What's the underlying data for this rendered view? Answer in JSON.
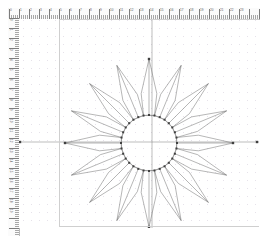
{
  "app": {
    "type": "vector-drawing-canvas",
    "background_color": "#ffffff"
  },
  "rulers": {
    "top": {
      "name": "horizontal-ruler",
      "unit": "cm",
      "labels": [
        "0",
        "1",
        "2",
        "3",
        "4",
        "5",
        "6",
        "7",
        "8",
        "9",
        "10",
        "11",
        "12",
        "13",
        "14",
        "15",
        "16",
        "17",
        "18",
        "19",
        "20",
        "21",
        "22",
        "23"
      ],
      "major_tick_spacing_px": 10,
      "minor_per_major": 5,
      "background_color": "#fbfbfb",
      "tick_color": "#8c8c8c"
    },
    "left": {
      "name": "vertical-ruler",
      "unit": "cm",
      "labels": [
        "0",
        "1",
        "2",
        "3",
        "4",
        "5",
        "6",
        "7",
        "8",
        "9",
        "10",
        "11",
        "12",
        "13",
        "14",
        "15",
        "16",
        "17",
        "18",
        "19"
      ],
      "major_tick_spacing_px": 10,
      "minor_per_major": 5,
      "background_color": "#fbfbfb",
      "tick_color": "#8c8c8c"
    }
  },
  "canvas": {
    "name": "drawing-canvas",
    "page_border_color": "#cfcfcf",
    "grid": {
      "visible": true,
      "type": "dot",
      "spacing_px": 8,
      "color": "#e6e2ea"
    },
    "guides": {
      "visible": true,
      "color": "#7a7a7a",
      "horizontal_y": 123,
      "vertical_x": 133,
      "endpoint_marker": "square-node"
    }
  },
  "drawing": {
    "name": "rosette-mandala",
    "shape": "radial-flower",
    "petal_count": 16,
    "petal_sides": 5,
    "stroke_color": "#6f6f6f",
    "stroke_width": 0.5,
    "fill": "none",
    "center_x": 130,
    "center_y": 124,
    "inner_radius": 28,
    "petal_mid_radius": 50,
    "outer_radius": 84,
    "center_circle": {
      "name": "center-circle",
      "radius": 28,
      "node_count": 16,
      "node_color": "#404040",
      "node_size_px": 2
    },
    "apex_nodes": {
      "visible": true,
      "color": "#404040",
      "positions": [
        "top",
        "bottom",
        "left",
        "right"
      ]
    }
  },
  "bottom": {
    "hint": ""
  }
}
